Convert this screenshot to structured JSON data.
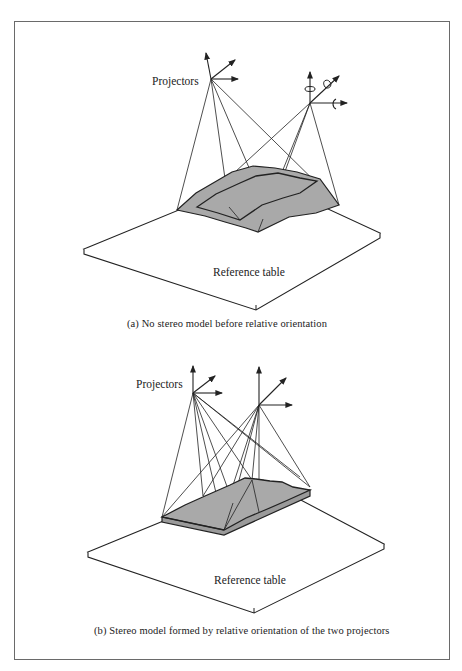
{
  "figure": {
    "panel_a": {
      "projectors_label": "Projectors",
      "table_label": "Reference table",
      "caption": "(a)  No stereo model before relative orientation",
      "icons": [
        "axis-arrows-icon",
        "rotation-arrows-icon"
      ]
    },
    "panel_b": {
      "projectors_label": "Projectors",
      "table_label": "Reference table",
      "caption": "(b)  Stereo model formed by relative orientation of the two projectors",
      "icons": [
        "axis-arrows-icon"
      ]
    },
    "colors": {
      "frame": "#6a6a6a",
      "line": "#222222",
      "model_fill": "#a9a9a9"
    }
  }
}
